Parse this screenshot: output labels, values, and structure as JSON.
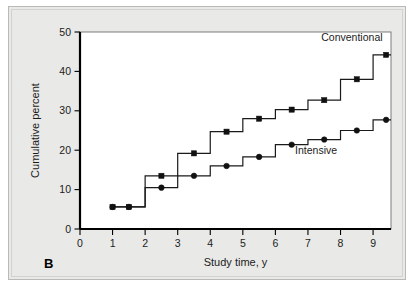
{
  "figure": {
    "panel_label": "B"
  },
  "chart_data": {
    "type": "line",
    "title": "",
    "subtitle": "",
    "xlabel": "Study time, y",
    "ylabel": "Cumulative percent",
    "xlim": [
      0,
      9.55
    ],
    "ylim": [
      0,
      50
    ],
    "xticks": [
      0,
      1,
      2,
      3,
      4,
      5,
      6,
      7,
      8,
      9
    ],
    "xticklabels": [
      "0",
      "1",
      "2",
      "3",
      "4",
      "5",
      "6",
      "7",
      "8",
      "9"
    ],
    "yticks": [
      0,
      10,
      20,
      30,
      40,
      50
    ],
    "yticklabels": [
      "0",
      "10",
      "20",
      "30",
      "40",
      "50"
    ],
    "grid": false,
    "legend_position": "inline-annotations",
    "step_type": "post",
    "series": [
      {
        "name": "Conventional",
        "marker": "square",
        "label_position": {
          "x": 8.35,
          "y": 47.6
        },
        "x": [
          1,
          1.5,
          2.5,
          3.5,
          4.5,
          5.5,
          6.5,
          7.5,
          8.5,
          9.4
        ],
        "values": [
          5.6,
          5.6,
          13.5,
          19.2,
          24.7,
          28.0,
          30.3,
          32.7,
          38.0,
          44.2
        ],
        "step_x": [
          1,
          2,
          3,
          4,
          5,
          6,
          7,
          8,
          9
        ],
        "step_levels": [
          5.6,
          13.5,
          19.2,
          24.7,
          28.0,
          30.3,
          32.7,
          38.0,
          44.2
        ]
      },
      {
        "name": "Intensive",
        "marker": "circle",
        "label_position": {
          "x": 7.25,
          "y": 19.0
        },
        "x": [
          1,
          1.5,
          2.5,
          3.5,
          4.5,
          5.5,
          6.5,
          7.5,
          8.5,
          9.4
        ],
        "values": [
          5.6,
          5.6,
          10.5,
          13.5,
          16.0,
          18.3,
          21.4,
          22.7,
          25.0,
          27.7
        ],
        "step_x": [
          1,
          2,
          3,
          4,
          5,
          6,
          7,
          8,
          9
        ],
        "step_levels": [
          5.6,
          10.5,
          13.5,
          16.0,
          18.3,
          21.4,
          22.7,
          25.0,
          27.7
        ]
      }
    ]
  },
  "colors": {
    "figure_background": "#e9e9e7",
    "plot_background": "#ffffff",
    "ink": "#1a1a1a",
    "frame": "#6f6f6f"
  }
}
